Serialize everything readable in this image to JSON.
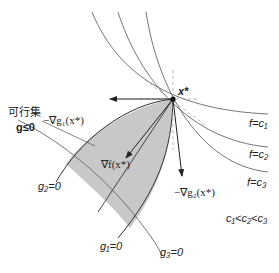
{
  "diagram": {
    "colors": {
      "feasible_fill": "#c8c8c8",
      "curve": "#555555",
      "arrow": "#222222",
      "text": "#222222"
    },
    "optimum": {
      "label": "x*"
    },
    "feasible_set": {
      "label_jp": "可行集",
      "label_math": "g≤0"
    },
    "constraints": [
      {
        "id": "g1",
        "label": "g₁=0"
      },
      {
        "id": "g2",
        "label": "g₂=0"
      },
      {
        "id": "g3",
        "label": "g₃=0"
      }
    ],
    "level_sets": [
      {
        "id": "c1",
        "label": "f=c₁"
      },
      {
        "id": "c2",
        "label": "f=c₂"
      },
      {
        "id": "c3",
        "label": "f=c₃"
      }
    ],
    "ordering_note": "c₁<c₂<c₃",
    "vectors": [
      {
        "id": "neg-grad-g1",
        "label": "−∇g₁(x*)"
      },
      {
        "id": "neg-grad-g2",
        "label": "−∇g₂(x*)"
      },
      {
        "id": "grad-f",
        "label": "∇f(x*)"
      }
    ]
  }
}
